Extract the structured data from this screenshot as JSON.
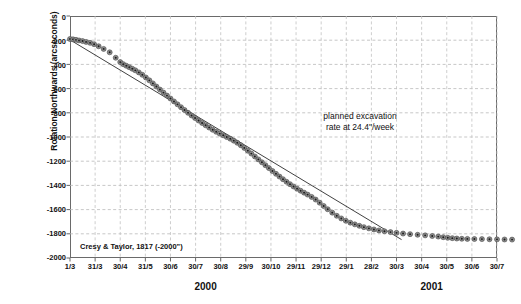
{
  "chart_data": {
    "type": "scatter",
    "title": "",
    "xlabel": "",
    "ylabel": "Rotation Northwards (arcseconds)",
    "ylim": [
      -2000,
      0
    ],
    "ytick_labels": [
      "0",
      "-200",
      "-400",
      "-600",
      "-800",
      "-1000",
      "-1200",
      "-1400",
      "-1600",
      "-1800",
      "-2000"
    ],
    "ytick_values": [
      0,
      -200,
      -400,
      -600,
      -800,
      -1000,
      -1200,
      -1400,
      -1600,
      -1800,
      -2000
    ],
    "xtick_labels": [
      "1/3",
      "31/3",
      "30/4",
      "31/5",
      "30/6",
      "30/7",
      "30/8",
      "29/9",
      "30/10",
      "29/11",
      "29/12",
      "29/1",
      "28/2",
      "30/3",
      "30/4",
      "30/5",
      "30/6",
      "30/7"
    ],
    "grid": "both, dashed light gray",
    "legend": "none",
    "group_labels": [
      {
        "text": "2000",
        "center_tick_index": 5.4
      },
      {
        "text": "2001",
        "center_tick_index": 14.4
      }
    ],
    "annotations": [
      {
        "text_line1": "planned excavation",
        "text_line2": "rate at 24.4\"/week"
      },
      {
        "text": "Cresy & Taylor, 1817 (-2000\")"
      }
    ],
    "series": [
      {
        "name": "measured rotation",
        "marker": "filled circle, dark gray",
        "color": "#3a3a3a",
        "points": [
          [
            0.0,
            -190
          ],
          [
            0.12,
            -193
          ],
          [
            0.24,
            -197
          ],
          [
            0.36,
            -202
          ],
          [
            0.5,
            -207
          ],
          [
            0.64,
            -214
          ],
          [
            0.8,
            -222
          ],
          [
            0.96,
            -233
          ],
          [
            1.14,
            -250
          ],
          [
            1.34,
            -272
          ],
          [
            1.58,
            -300
          ],
          [
            1.82,
            -345
          ],
          [
            2.0,
            -381
          ],
          [
            2.12,
            -398
          ],
          [
            2.24,
            -411
          ],
          [
            2.36,
            -423
          ],
          [
            2.48,
            -436
          ],
          [
            2.6,
            -449
          ],
          [
            2.74,
            -466
          ],
          [
            2.88,
            -486
          ],
          [
            3.02,
            -508
          ],
          [
            3.16,
            -532
          ],
          [
            3.3,
            -557
          ],
          [
            3.44,
            -583
          ],
          [
            3.58,
            -608
          ],
          [
            3.72,
            -633
          ],
          [
            3.86,
            -658
          ],
          [
            4.0,
            -682
          ],
          [
            4.14,
            -706
          ],
          [
            4.28,
            -730
          ],
          [
            4.42,
            -754
          ],
          [
            4.56,
            -777
          ],
          [
            4.7,
            -800
          ],
          [
            4.84,
            -822
          ],
          [
            4.98,
            -843
          ],
          [
            5.12,
            -864
          ],
          [
            5.26,
            -884
          ],
          [
            5.4,
            -903
          ],
          [
            5.54,
            -922
          ],
          [
            5.68,
            -940
          ],
          [
            5.82,
            -957
          ],
          [
            5.96,
            -972
          ],
          [
            6.1,
            -986
          ],
          [
            6.24,
            -1000
          ],
          [
            6.38,
            -1014
          ],
          [
            6.52,
            -1030
          ],
          [
            6.66,
            -1048
          ],
          [
            6.8,
            -1068
          ],
          [
            6.94,
            -1090
          ],
          [
            7.08,
            -1113
          ],
          [
            7.22,
            -1137
          ],
          [
            7.36,
            -1161
          ],
          [
            7.5,
            -1185
          ],
          [
            7.64,
            -1209
          ],
          [
            7.78,
            -1233
          ],
          [
            7.92,
            -1257
          ],
          [
            8.06,
            -1281
          ],
          [
            8.2,
            -1304
          ],
          [
            8.34,
            -1327
          ],
          [
            8.48,
            -1349
          ],
          [
            8.62,
            -1370
          ],
          [
            8.76,
            -1390
          ],
          [
            8.9,
            -1409
          ],
          [
            9.04,
            -1427
          ],
          [
            9.18,
            -1444
          ],
          [
            9.32,
            -1460
          ],
          [
            9.46,
            -1476
          ],
          [
            9.62,
            -1495
          ],
          [
            9.78,
            -1517
          ],
          [
            9.94,
            -1543
          ],
          [
            10.1,
            -1570
          ],
          [
            10.26,
            -1597
          ],
          [
            10.44,
            -1625
          ],
          [
            10.62,
            -1651
          ],
          [
            10.8,
            -1673
          ],
          [
            10.98,
            -1692
          ],
          [
            11.16,
            -1708
          ],
          [
            11.34,
            -1722
          ],
          [
            11.52,
            -1734
          ],
          [
            11.7,
            -1745
          ],
          [
            11.9,
            -1755
          ],
          [
            12.1,
            -1764
          ],
          [
            12.3,
            -1772
          ],
          [
            12.52,
            -1779
          ],
          [
            12.76,
            -1786
          ],
          [
            13.0,
            -1792
          ],
          [
            13.26,
            -1798
          ],
          [
            13.54,
            -1803
          ],
          [
            13.84,
            -1808
          ],
          [
            14.14,
            -1813
          ],
          [
            14.42,
            -1818
          ],
          [
            14.66,
            -1823
          ],
          [
            14.86,
            -1828
          ],
          [
            15.04,
            -1833
          ],
          [
            15.22,
            -1836
          ],
          [
            15.4,
            -1839
          ],
          [
            15.6,
            -1841
          ],
          [
            15.82,
            -1842
          ],
          [
            16.1,
            -1843
          ],
          [
            16.4,
            -1844
          ],
          [
            16.7,
            -1845
          ],
          [
            17.0,
            -1846
          ],
          [
            17.3,
            -1847
          ],
          [
            17.6,
            -1848
          ]
        ]
      },
      {
        "name": "planned excavation rate at 24.4\"/week",
        "marker": "none",
        "style": "solid thin line",
        "color": "#2b2b2b",
        "points": [
          [
            0.0,
            -197
          ],
          [
            13.2,
            -1848
          ]
        ]
      }
    ]
  }
}
